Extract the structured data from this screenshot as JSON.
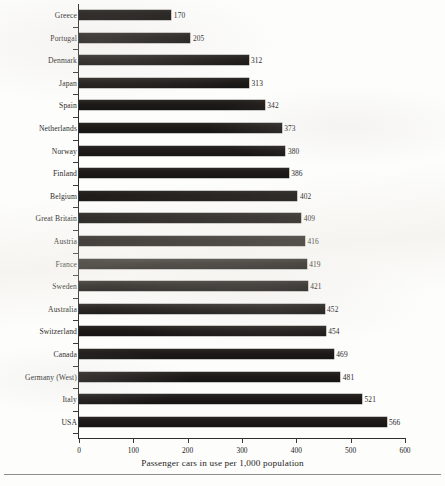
{
  "chart_data": {
    "type": "bar",
    "orientation": "horizontal",
    "title": "",
    "xlabel": "Passenger cars in use per 1,000 population",
    "ylabel": "",
    "xlim": [
      0,
      600
    ],
    "xticks": [
      0,
      100,
      200,
      300,
      400,
      500,
      600
    ],
    "xtick_labels": [
      "0",
      "100",
      "200",
      "300",
      "400",
      "500",
      "600"
    ],
    "grid": false,
    "legend": null,
    "bar_color": "#1d1a18",
    "value_labels": true,
    "categories": [
      "Greece",
      "Portugal",
      "Denmark",
      "Japan",
      "Spain",
      "Netherlands",
      "Norway",
      "Finland",
      "Belgium",
      "Great Britain",
      "Austria",
      "France",
      "Sweden",
      "Australia",
      "Switzerland",
      "Canada",
      "Germany (West)",
      "Italy",
      "USA"
    ],
    "values": [
      170,
      205,
      312,
      313,
      342,
      373,
      380,
      386,
      402,
      409,
      416,
      419,
      421,
      452,
      454,
      469,
      481,
      521,
      566
    ],
    "value_label_texts": [
      "170",
      "205",
      "312",
      "313",
      "342",
      "373",
      "380",
      "386",
      "402",
      "409",
      "416",
      "419",
      "421",
      "452",
      "454",
      "469",
      "481",
      "521",
      "566"
    ]
  }
}
